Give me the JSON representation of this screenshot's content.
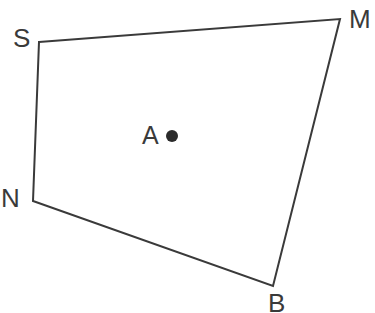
{
  "figure": {
    "type": "quadrilateral-with-interior-point",
    "background_color": "#ffffff",
    "stroke_color": "#3a3a3a",
    "stroke_width": 2,
    "canvas": {
      "width": 375,
      "height": 313
    },
    "vertices": [
      {
        "id": "S",
        "label": "S",
        "x": 39,
        "y": 42,
        "label_x": 13,
        "label_y": 25
      },
      {
        "id": "M",
        "label": "M",
        "x": 340,
        "y": 19,
        "label_x": 349,
        "label_y": 6
      },
      {
        "id": "B",
        "label": "B",
        "x": 273,
        "y": 286,
        "label_x": 268,
        "label_y": 290
      },
      {
        "id": "N",
        "label": "N",
        "x": 33,
        "y": 201,
        "label_x": 1,
        "label_y": 185
      }
    ],
    "edges": [
      {
        "from": "S",
        "to": "M"
      },
      {
        "from": "M",
        "to": "B"
      },
      {
        "from": "B",
        "to": "N"
      },
      {
        "from": "N",
        "to": "S"
      }
    ],
    "interior_point": {
      "id": "A",
      "label": "A",
      "x": 172,
      "y": 136,
      "radius": 6,
      "fill_color": "#2b2b2b",
      "label_x": 142,
      "label_y": 123
    },
    "polygon_points": "39,42 340,19 273,286 33,201"
  }
}
